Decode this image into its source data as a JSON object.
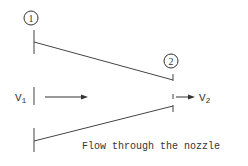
{
  "diagram": {
    "caption": "Flow through the nozzle",
    "stations": [
      {
        "id": "1",
        "label": "1"
      },
      {
        "id": "2",
        "label": "2"
      }
    ],
    "velocities": {
      "inlet": {
        "symbol": "V",
        "subscript": "1"
      },
      "outlet": {
        "symbol": "V",
        "subscript": "2"
      }
    },
    "colors": {
      "stroke": "#444444",
      "text": "#333333",
      "background": "#ffffff"
    }
  }
}
